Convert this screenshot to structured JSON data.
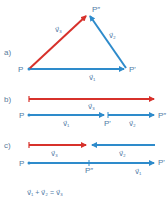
{
  "colors": {
    "red": "#d7312b",
    "blue": "#2e8bcb",
    "label": "#4f7aa6"
  },
  "parts": {
    "a": {
      "label": "a)",
      "points": {
        "P": "P",
        "P1": "P'",
        "P2": "P″"
      },
      "vectors": {
        "v1": "v⃗₁",
        "v2": "v⃗₂",
        "v3": "v⃗₃"
      }
    },
    "b": {
      "label": "b)",
      "points": {
        "P": "P",
        "P1": "P'",
        "P2": "P″"
      },
      "vectors": {
        "v1": "v⃗₁",
        "v2": "v⃗₂",
        "v3": "v⃗₃"
      }
    },
    "c": {
      "label": "c)",
      "points": {
        "P": "P",
        "P1": "P'",
        "P2": "P″"
      },
      "vectors": {
        "v1": "v⃗₁",
        "v2": "v⃗₂",
        "v3": "v⃗₃"
      }
    }
  },
  "equation": "v⃗₁ + v⃗₂ = v⃗₃"
}
